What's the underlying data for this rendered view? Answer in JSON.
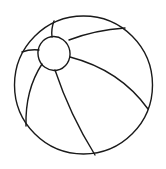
{
  "image": {
    "subject": "beach ball line drawing",
    "background": "#ffffff",
    "stroke_color": "#1a1a1a"
  }
}
